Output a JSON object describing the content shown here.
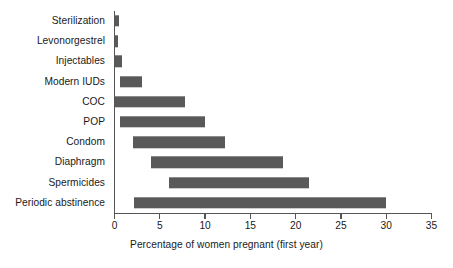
{
  "chart_data": {
    "type": "bar",
    "orientation": "horizontal",
    "style": "range-bar",
    "title": "",
    "subtitle": "",
    "xlabel": "Percentage of women pregnant (first year)",
    "ylabel": "",
    "xlim": [
      0,
      35
    ],
    "xticks": [
      0,
      5,
      10,
      15,
      20,
      25,
      30,
      35
    ],
    "xtick_labels": [
      "0",
      "5",
      "10",
      "15",
      "20",
      "25",
      "30",
      "35"
    ],
    "grid": false,
    "legend": null,
    "bar_color": "#595959",
    "axis_color": "#555555",
    "text_color": "#1a1a1a",
    "background": "#ffffff",
    "categories": [
      "Sterilization",
      "Levonorgestrel",
      "Injectables",
      "Modern IUDs",
      "COC",
      "POP",
      "Condom",
      "Diaphragm",
      "Spermicides",
      "Periodic abstinence"
    ],
    "series": [
      {
        "name": "Percentage of women pregnant (first year)",
        "ranges": [
          {
            "category": "Sterilization",
            "low": 0.1,
            "high": 0.5
          },
          {
            "category": "Levonorgestrel",
            "low": 0.1,
            "high": 0.3
          },
          {
            "category": "Injectables",
            "low": 0.1,
            "high": 0.8
          },
          {
            "category": "Modern IUDs",
            "low": 0.6,
            "high": 3.0
          },
          {
            "category": "COC",
            "low": 0.1,
            "high": 7.8
          },
          {
            "category": "POP",
            "low": 0.6,
            "high": 10.0
          },
          {
            "category": "Condom",
            "low": 2.0,
            "high": 12.2
          },
          {
            "category": "Diaphragm",
            "low": 4.0,
            "high": 18.6
          },
          {
            "category": "Spermicides",
            "low": 6.0,
            "high": 21.5
          },
          {
            "category": "Periodic abstinence",
            "low": 2.1,
            "high": 30.0
          }
        ]
      }
    ]
  }
}
